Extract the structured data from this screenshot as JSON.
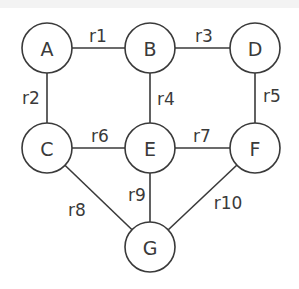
{
  "diagram": {
    "type": "undirected-graph",
    "nodes": [
      {
        "id": "A",
        "label": "A",
        "x": 47,
        "y": 48
      },
      {
        "id": "B",
        "label": "B",
        "x": 150,
        "y": 48
      },
      {
        "id": "D",
        "label": "D",
        "x": 255,
        "y": 48
      },
      {
        "id": "C",
        "label": "C",
        "x": 47,
        "y": 148
      },
      {
        "id": "E",
        "label": "E",
        "x": 150,
        "y": 148
      },
      {
        "id": "F",
        "label": "F",
        "x": 255,
        "y": 148
      },
      {
        "id": "G",
        "label": "G",
        "x": 150,
        "y": 247
      }
    ],
    "edges": [
      {
        "id": "r1",
        "label": "r1",
        "from": "A",
        "to": "B",
        "lx": 98,
        "ly": 36
      },
      {
        "id": "r2",
        "label": "r2",
        "from": "A",
        "to": "C",
        "lx": 31,
        "ly": 98
      },
      {
        "id": "r3",
        "label": "r3",
        "from": "B",
        "to": "D",
        "lx": 204,
        "ly": 36
      },
      {
        "id": "r4",
        "label": "r4",
        "from": "B",
        "to": "E",
        "lx": 166,
        "ly": 99
      },
      {
        "id": "r5",
        "label": "r5",
        "from": "D",
        "to": "F",
        "lx": 272,
        "ly": 96
      },
      {
        "id": "r6",
        "label": "r6",
        "from": "C",
        "to": "E",
        "lx": 100,
        "ly": 136
      },
      {
        "id": "r7",
        "label": "r7",
        "from": "E",
        "to": "F",
        "lx": 202,
        "ly": 136
      },
      {
        "id": "r8",
        "label": "r8",
        "from": "C",
        "to": "G",
        "lx": 77,
        "ly": 210
      },
      {
        "id": "r9",
        "label": "r9",
        "from": "E",
        "to": "G",
        "lx": 137,
        "ly": 195
      },
      {
        "id": "r10",
        "label": "r10",
        "from": "F",
        "to": "G",
        "lx": 228,
        "ly": 203
      }
    ],
    "node_radius": 25,
    "stroke_color": "#3a3a3a",
    "background": "#ffffff"
  }
}
